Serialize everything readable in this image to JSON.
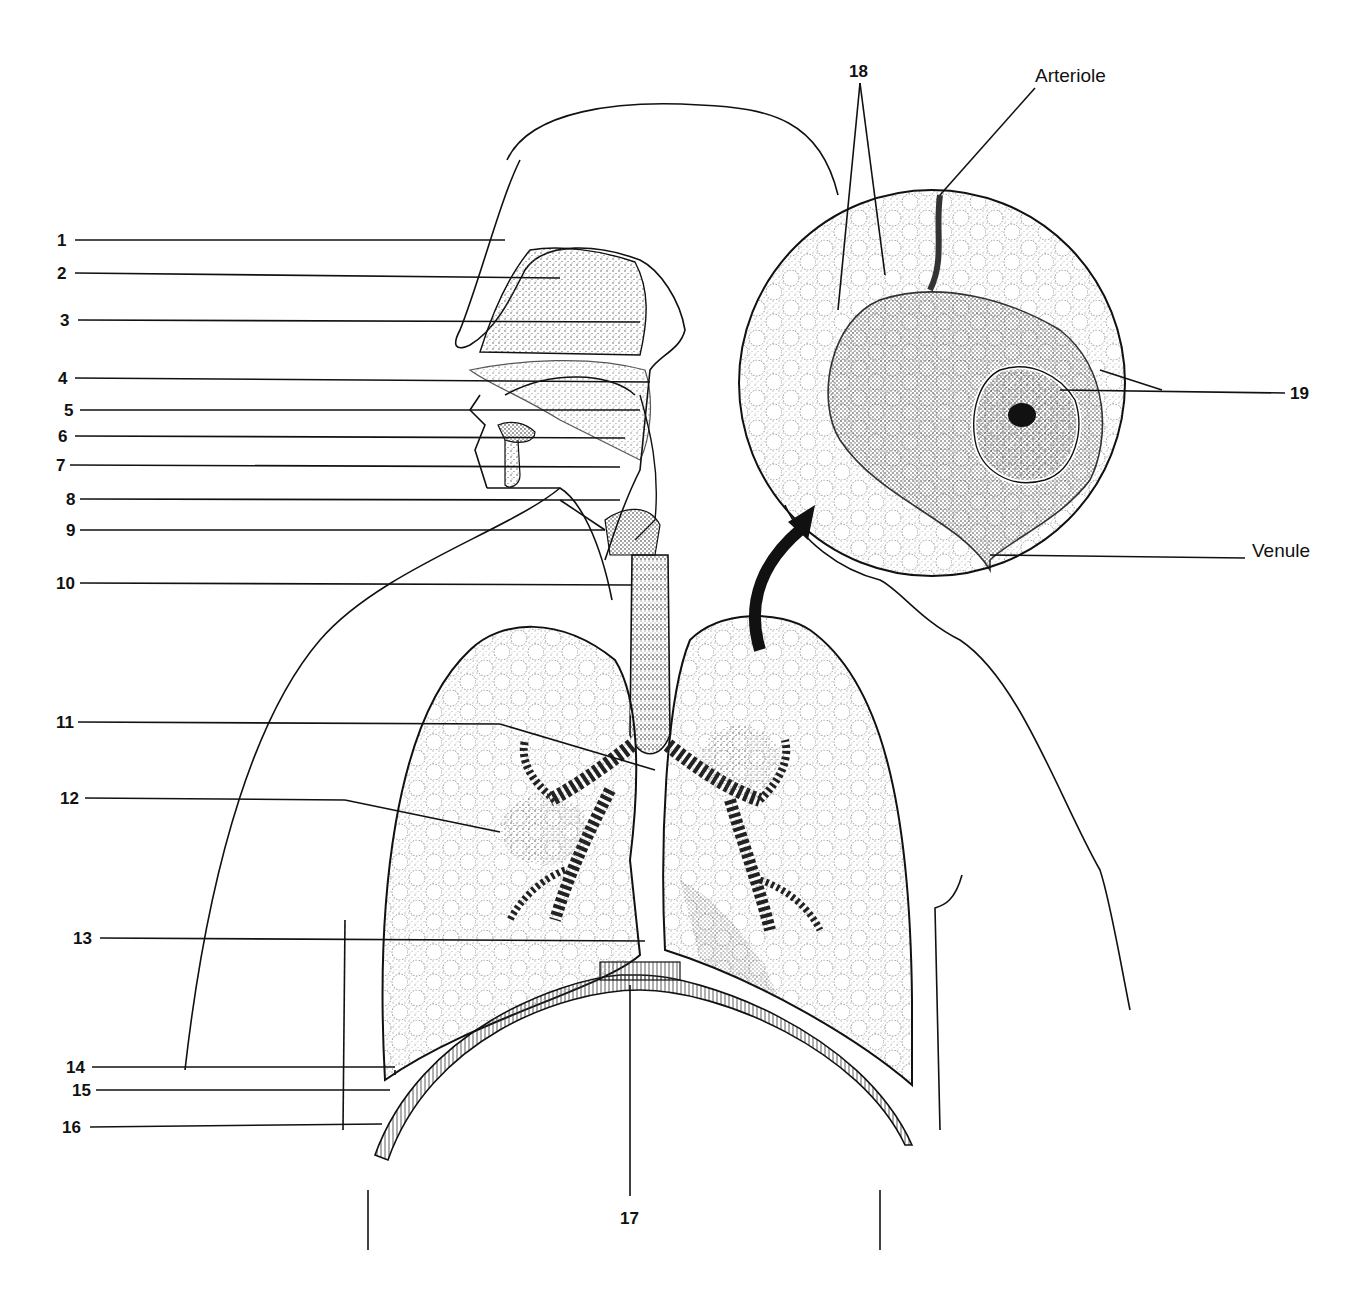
{
  "diagram": {
    "labels": [
      {
        "id": "1",
        "text": "1"
      },
      {
        "id": "2",
        "text": "2"
      },
      {
        "id": "3",
        "text": "3"
      },
      {
        "id": "4",
        "text": "4"
      },
      {
        "id": "5",
        "text": "5"
      },
      {
        "id": "6",
        "text": "6"
      },
      {
        "id": "7",
        "text": "7"
      },
      {
        "id": "8",
        "text": "8"
      },
      {
        "id": "9",
        "text": "9"
      },
      {
        "id": "10",
        "text": "10"
      },
      {
        "id": "11",
        "text": "11"
      },
      {
        "id": "12",
        "text": "12"
      },
      {
        "id": "13",
        "text": "13"
      },
      {
        "id": "14",
        "text": "14"
      },
      {
        "id": "15",
        "text": "15"
      },
      {
        "id": "16",
        "text": "16"
      },
      {
        "id": "17",
        "text": "17"
      },
      {
        "id": "18",
        "text": "18"
      },
      {
        "id": "19",
        "text": "19"
      }
    ],
    "named_labels": {
      "arteriole": "Arteriole",
      "venule": "Venule"
    },
    "colors": {
      "ink": "#111111",
      "background": "#ffffff",
      "stipple": "#555555"
    }
  }
}
